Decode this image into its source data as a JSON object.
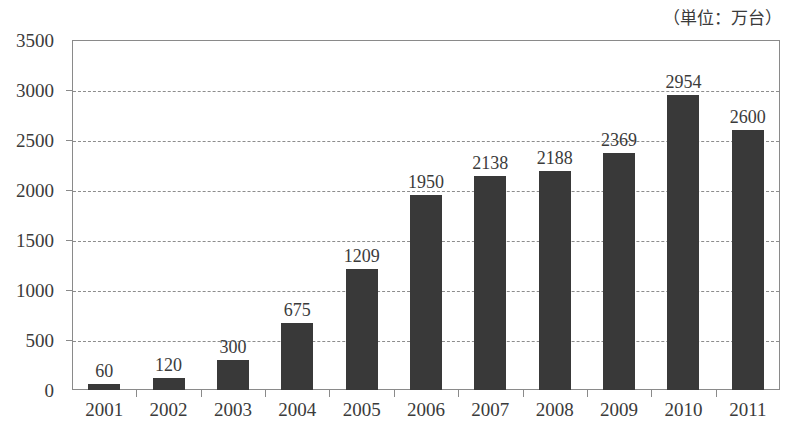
{
  "chart_data": {
    "type": "bar",
    "title": "",
    "subtitle": "",
    "unit_note": "（単位：万台）",
    "xlabel": "",
    "ylabel": "",
    "categories": [
      "2001",
      "2002",
      "2003",
      "2004",
      "2005",
      "2006",
      "2007",
      "2008",
      "2009",
      "2010",
      "2011"
    ],
    "values": [
      60,
      120,
      300,
      675,
      1209,
      1950,
      2138,
      2188,
      2369,
      2954,
      2600
    ],
    "value_labels": [
      "60",
      "120",
      "300",
      "675",
      "1209",
      "1950",
      "2138",
      "2188",
      "2369",
      "2954",
      "2600"
    ],
    "ylim": [
      0,
      3500
    ],
    "y_ticks": [
      0,
      500,
      1000,
      1500,
      2000,
      2500,
      3000,
      3500
    ],
    "y_tick_labels": [
      "0",
      "500",
      "1000",
      "1500",
      "2000",
      "2500",
      "3000",
      "3500"
    ],
    "grid": "horizontal-dashed",
    "legend": "none",
    "bar_color": "#393939",
    "axis_color": "#8a8a8a",
    "grid_color": "#8d8d8d",
    "text_color": "#3b3b3b",
    "background": "#ffffff"
  }
}
